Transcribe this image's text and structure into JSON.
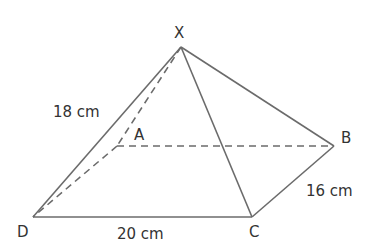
{
  "figure": {
    "type": "square-based pyramid (rectangular base)",
    "vertices": {
      "X": {
        "label": "X",
        "x": 181,
        "y": 47
      },
      "A": {
        "label": "A",
        "x": 117,
        "y": 146
      },
      "B": {
        "label": "B",
        "x": 334,
        "y": 146
      },
      "C": {
        "label": "C",
        "x": 252,
        "y": 217
      },
      "D": {
        "label": "D",
        "x": 33,
        "y": 217
      }
    },
    "measurements": {
      "XD": "18 cm",
      "DC": "20 cm",
      "CB": "16 cm"
    },
    "colors": {
      "line": "#6b6b6b",
      "text": "#333333",
      "background": "#ffffff"
    }
  }
}
